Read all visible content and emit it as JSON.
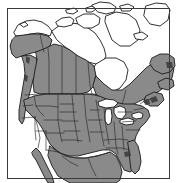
{
  "figure": {
    "kind": "species-range-map",
    "title": "North America distribution map",
    "caption": "",
    "width_px": 176,
    "height_px": 183,
    "background_color": "#ffffff"
  },
  "frame": {
    "name": "map-border",
    "visible": true,
    "stroke_color": "#3a3a3a",
    "stroke_width_px": 1,
    "inset": {
      "left": 7,
      "top": 8,
      "right": 169,
      "bottom": 178
    }
  },
  "legend": {
    "visible": false,
    "entries": [
      {
        "label": "Range (shaded)",
        "swatch_color": "#8a8a8a"
      },
      {
        "label": "Outside range",
        "swatch_color": "#ffffff"
      }
    ]
  },
  "style": {
    "range_fill": "#8a8a8a",
    "range_fill_dark": "#6e6e6e",
    "outside_fill": "#ffffff",
    "water_fill": "#ffffff",
    "coastline_stroke": "#1a1a1a",
    "coastline_width_px": 0.9,
    "internal_border_stroke": "#2b2b2b",
    "internal_border_width_px": 0.7
  },
  "regions": {
    "shaded": [
      "Alaska (southern and central)",
      "Yukon",
      "British Columbia",
      "Alberta",
      "Saskatchewan",
      "Manitoba (southern)",
      "Ontario",
      "Quebec (southern)",
      "Labrador coast",
      "Newfoundland",
      "New Brunswick",
      "Nova Scotia",
      "Contiguous United States",
      "Northern Mexico"
    ],
    "unshaded": [
      "Arctic Archipelago",
      "Baffin Island",
      "Ellesmere Island",
      "Victoria Island",
      "Banks Island",
      "Northern Alaska",
      "Nunavut mainland (northern)",
      "Greenland edge",
      "Great Lakes",
      "Hudson Bay"
    ]
  },
  "features": {
    "great_lakes": [
      "Superior",
      "Michigan",
      "Huron",
      "Erie",
      "Ontario"
    ],
    "bays": [
      "Hudson Bay",
      "James Bay",
      "Gulf of Mexico",
      "Gulf of California"
    ],
    "peninsulas": [
      "Florida",
      "Baja California",
      "Alaska Peninsula"
    ]
  }
}
